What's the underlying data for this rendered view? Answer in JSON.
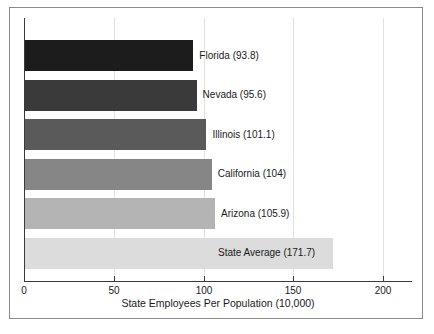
{
  "chart_data": {
    "type": "bar",
    "orientation": "horizontal",
    "title": "",
    "xlabel": "State Employees Per Population (10,000)",
    "ylabel": "",
    "xlim": [
      0,
      215
    ],
    "xticks": [
      0,
      50,
      100,
      150,
      200
    ],
    "xtick_labels": [
      "0",
      "50",
      "100",
      "150",
      "200"
    ],
    "grid": true,
    "grid_axis": "x",
    "legend": "none",
    "categories": [
      "Florida",
      "Nevada",
      "Illinois",
      "California",
      "Arizona",
      "State Average"
    ],
    "values": [
      93.8,
      95.6,
      101.1,
      104,
      105.9,
      171.7
    ],
    "bar_labels": [
      "Florida (93.8)",
      "Nevada (95.6)",
      "Illinois (101.1)",
      "California (104)",
      "Arizona (105.9)",
      "State Average (171.7)"
    ],
    "bar_colors": [
      "#1c1c1c",
      "#3a3a3a",
      "#5a5a5a",
      "#868686",
      "#b4b4b4",
      "#dcdcdc"
    ],
    "series": [
      {
        "name": "State Employees Per Population (10,000)",
        "values": [
          93.8,
          95.6,
          101.1,
          104,
          105.9,
          171.7
        ]
      }
    ]
  },
  "axis": {
    "x_title": "State Employees Per Population (10,000)",
    "tick_0": "0",
    "tick_50": "50",
    "tick_100": "100",
    "tick_150": "150",
    "tick_200": "200"
  },
  "bars": [
    {
      "label": "Florida (93.8)",
      "category": "Florida",
      "value": 93.8,
      "color": "#1c1c1c"
    },
    {
      "label": "Nevada (95.6)",
      "category": "Nevada",
      "value": 95.6,
      "color": "#3a3a3a"
    },
    {
      "label": "Illinois (101.1)",
      "category": "Illinois",
      "value": 101.1,
      "color": "#5a5a5a"
    },
    {
      "label": "California (104)",
      "category": "California",
      "value": 104,
      "color": "#868686"
    },
    {
      "label": "Arizona (105.9)",
      "category": "Arizona",
      "value": 105.9,
      "color": "#b4b4b4"
    },
    {
      "label": "State Average (171.7)",
      "category": "State Average",
      "value": 171.7,
      "color": "#dcdcdc"
    }
  ]
}
